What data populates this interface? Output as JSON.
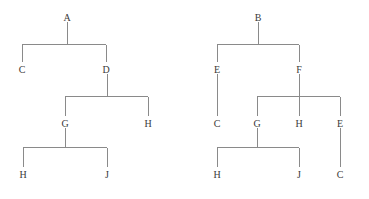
{
  "figure": {
    "background_color": "#ffffff",
    "line_color": "#8a8a8a",
    "text_color": "#3a3a3a"
  },
  "trees": [
    {
      "name": "left-tree",
      "root": "A",
      "nodes": [
        {
          "id": "L-A",
          "label": "A",
          "x": 67,
          "y": 18,
          "level": 0
        },
        {
          "id": "L-C",
          "label": "C",
          "x": 22,
          "y": 70,
          "level": 1
        },
        {
          "id": "L-D",
          "label": "D",
          "x": 106,
          "y": 70,
          "level": 1
        },
        {
          "id": "L-G",
          "label": "G",
          "x": 65,
          "y": 124,
          "level": 2
        },
        {
          "id": "L-H1",
          "label": "H",
          "x": 148,
          "y": 124,
          "level": 2
        },
        {
          "id": "L-H2",
          "label": "H",
          "x": 23,
          "y": 175,
          "level": 3
        },
        {
          "id": "L-J",
          "label": "J",
          "x": 107,
          "y": 175,
          "level": 3
        }
      ],
      "edges": [
        {
          "from": "L-A",
          "to": "L-C"
        },
        {
          "from": "L-A",
          "to": "L-D"
        },
        {
          "from": "L-D",
          "to": "L-G"
        },
        {
          "from": "L-D",
          "to": "L-H1"
        },
        {
          "from": "L-G",
          "to": "L-H2"
        },
        {
          "from": "L-G",
          "to": "L-J"
        }
      ]
    },
    {
      "name": "right-tree",
      "root": "B",
      "nodes": [
        {
          "id": "R-B",
          "label": "B",
          "x": 258,
          "y": 18,
          "level": 0
        },
        {
          "id": "R-E1",
          "label": "E",
          "x": 217,
          "y": 70,
          "level": 1
        },
        {
          "id": "R-F",
          "label": "F",
          "x": 299,
          "y": 70,
          "level": 1
        },
        {
          "id": "R-C1",
          "label": "C",
          "x": 217,
          "y": 124,
          "level": 2
        },
        {
          "id": "R-G",
          "label": "G",
          "x": 257,
          "y": 124,
          "level": 2
        },
        {
          "id": "R-H1",
          "label": "H",
          "x": 299,
          "y": 124,
          "level": 2
        },
        {
          "id": "R-E2",
          "label": "E",
          "x": 340,
          "y": 124,
          "level": 2
        },
        {
          "id": "R-H2",
          "label": "H",
          "x": 217,
          "y": 175,
          "level": 3
        },
        {
          "id": "R-J",
          "label": "J",
          "x": 299,
          "y": 175,
          "level": 3
        },
        {
          "id": "R-C2",
          "label": "C",
          "x": 340,
          "y": 175,
          "level": 3
        }
      ],
      "edges": [
        {
          "from": "R-B",
          "to": "R-E1"
        },
        {
          "from": "R-B",
          "to": "R-F"
        },
        {
          "from": "R-E1",
          "to": "R-C1"
        },
        {
          "from": "R-F",
          "to": "R-G"
        },
        {
          "from": "R-F",
          "to": "R-H1"
        },
        {
          "from": "R-F",
          "to": "R-E2"
        },
        {
          "from": "R-G",
          "to": "R-H2"
        },
        {
          "from": "R-G",
          "to": "R-J"
        },
        {
          "from": "R-E2",
          "to": "R-C2"
        }
      ]
    }
  ],
  "labels": {
    "left": {
      "a": "A",
      "c": "C",
      "d": "D",
      "g": "G",
      "h_mid": "H",
      "h_leaf": "H",
      "j": "J"
    },
    "right": {
      "b": "B",
      "e_left": "E",
      "f": "F",
      "c_under_e": "C",
      "g": "G",
      "h_mid": "H",
      "e_right": "E",
      "h_leaf": "H",
      "j": "J",
      "c_leaf": "C"
    }
  }
}
